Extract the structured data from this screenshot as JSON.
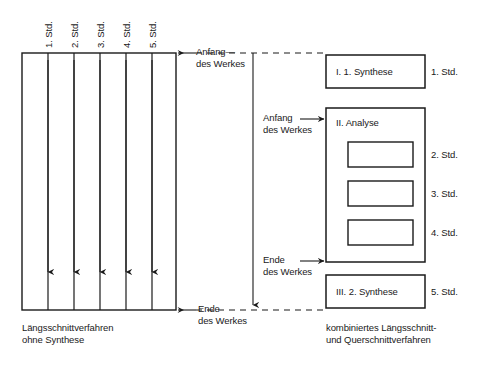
{
  "diagram": {
    "title_implicit": "Längsschnitt- und Querschnittverfahren Schema",
    "left_columns": [
      {
        "label": "1. Std."
      },
      {
        "label": "2. Std."
      },
      {
        "label": "3. Std."
      },
      {
        "label": "4. Std."
      },
      {
        "label": "5. Std."
      }
    ],
    "left_caption": {
      "line1": "Längsschnittverfahren",
      "line2": "ohne Synthese"
    },
    "right_caption": {
      "line1": "kombiniertes Längsschnitt-",
      "line2": "und Querschnittverfahren"
    },
    "markers": {
      "top_left": {
        "line1": "Anfang—",
        "line2": "des Werkes"
      },
      "bottom_left": {
        "line1": "Ende",
        "line2": "des Werkes"
      },
      "mid_anfang": {
        "line1": "Anfang",
        "line2": "des Werkes"
      },
      "mid_ende": {
        "line1": "Ende",
        "line2": "des Werkes"
      }
    },
    "right_boxes": [
      {
        "title": "I. 1. Synthese",
        "side_label": "1. Std."
      },
      {
        "title": "II. Analyse",
        "side_label": ""
      },
      {
        "title": "III. 2. Synthese",
        "side_label": "5. Std."
      }
    ],
    "analyse_inner_labels": [
      {
        "side_label": "2. Std."
      },
      {
        "side_label": "3. Std."
      },
      {
        "side_label": "4. Std."
      }
    ],
    "colors": {
      "ink": "#1a1a1a",
      "paper": "#ffffff"
    }
  }
}
